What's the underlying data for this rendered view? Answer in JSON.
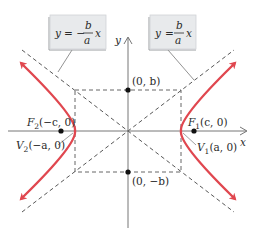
{
  "diagram": {
    "axes": {
      "x_label": "x",
      "y_label": "y"
    },
    "asymptotes": [
      {
        "label": "y = -(b/a)x",
        "lhs": "y",
        "sign": "= −",
        "num": "b",
        "den": "a",
        "var": "x"
      },
      {
        "label": "y = (b/a)x",
        "lhs": "y",
        "sign": "=",
        "num": "b",
        "den": "a",
        "var": "x"
      }
    ],
    "points": {
      "top": "(0, b)",
      "bottom": "(0, −b)",
      "focus_left_name": "F",
      "focus_left_sub": "2",
      "focus_left_coords": "(−c, 0)",
      "focus_right_name": "F",
      "focus_right_sub": "1",
      "focus_right_coords": "(c, 0)",
      "vertex_left_name": "V",
      "vertex_left_sub": "2",
      "vertex_left_coords": "(−a, 0)",
      "vertex_right_name": "V",
      "vertex_right_sub": "1",
      "vertex_right_coords": "(a, 0)"
    },
    "colors": {
      "curve": "#e0474f",
      "axis": "#555555",
      "dashed": "#444444",
      "box_fill": "#e8eaec",
      "text": "#2a2a2a"
    }
  }
}
